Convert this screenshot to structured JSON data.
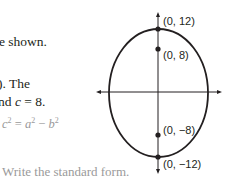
{
  "text": {
    "line1": "e shown.",
    "line2": "). The",
    "line3_prefix": "nd ",
    "line3_var": "c",
    "line3_suffix": " = 8.",
    "equation": {
      "lhs": "c",
      "lhs_exp": "2",
      "eq": " = ",
      "a": "a",
      "a_exp": "2",
      "minus": " − ",
      "b": "b",
      "b_exp": "2"
    },
    "instruction": "Write the standard form."
  },
  "diagram": {
    "type": "ellipse",
    "orientation": "vertical major axis",
    "points": [
      {
        "label": "(0, 12)",
        "role": "vertex"
      },
      {
        "label": "(0, 8)",
        "role": "focus"
      },
      {
        "label": "(0, −8)",
        "role": "focus"
      },
      {
        "label": "(0, −12)",
        "role": "vertex"
      }
    ],
    "colors": {
      "stroke": "#231f20",
      "text_gray": "#9a9a9a"
    }
  }
}
